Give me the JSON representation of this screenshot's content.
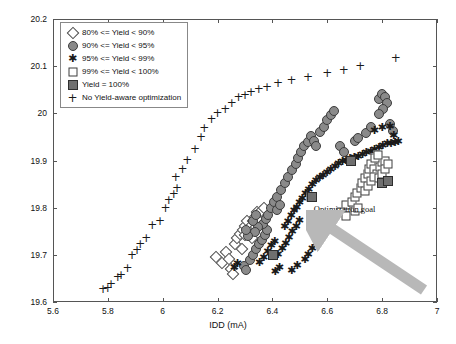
{
  "axes": {
    "x_title": "IDD (mA)",
    "y_title": "S21 (dB)",
    "x_ticks": [
      "5.6",
      "5.8",
      "6",
      "6.2",
      "6.4",
      "6.6",
      "6.8",
      "7"
    ],
    "y_ticks": [
      "19.6",
      "19.7",
      "19.8",
      "19.9",
      "20",
      "20.1",
      "20.2"
    ]
  },
  "legend": {
    "items": [
      {
        "marker": "open-diamond",
        "label": "80% <= Yield < 90%"
      },
      {
        "marker": "filled-circle",
        "label": "90% <= Yield < 95%"
      },
      {
        "marker": "asterisk",
        "label": "95% <= Yield < 99%"
      },
      {
        "marker": "open-square",
        "label": "99% <= Yield < 100%"
      },
      {
        "marker": "filled-square",
        "label": "Yield = 100%"
      },
      {
        "marker": "plus",
        "label": "No Yield-aware optimization"
      }
    ]
  },
  "annotation": {
    "text": "Optimization goal",
    "arrow_color": "#b3b3b3",
    "arrow_from": [
      6.92,
      19.64
    ],
    "arrow_to": [
      6.62,
      19.77
    ]
  },
  "chart_data": {
    "type": "scatter",
    "title": "",
    "xlabel": "IDD (mA)",
    "ylabel": "S21 (dB)",
    "xlim": [
      5.6,
      7.0
    ],
    "ylim": [
      19.6,
      20.2
    ],
    "grid": false,
    "legend_position": "top-left",
    "series": [
      {
        "name": "80% <= Yield < 90%",
        "marker": "open-diamond",
        "color": "#ffffff",
        "edge_color": "#4a4a4a",
        "points": [
          [
            6.195,
            19.695
          ],
          [
            6.215,
            19.682
          ],
          [
            6.232,
            19.705
          ],
          [
            6.243,
            19.692
          ],
          [
            6.262,
            19.724
          ],
          [
            6.272,
            19.735
          ],
          [
            6.283,
            19.745
          ],
          [
            6.292,
            19.752
          ],
          [
            6.3,
            19.762
          ],
          [
            6.308,
            19.771
          ],
          [
            6.3,
            19.742
          ],
          [
            6.312,
            19.752
          ],
          [
            6.322,
            19.762
          ],
          [
            6.33,
            19.772
          ],
          [
            6.338,
            19.781
          ],
          [
            6.345,
            19.79
          ],
          [
            6.352,
            19.783
          ],
          [
            6.36,
            19.793
          ],
          [
            6.368,
            19.8
          ],
          [
            6.34,
            19.76
          ],
          [
            6.355,
            19.77
          ],
          [
            6.327,
            19.735
          ],
          [
            6.288,
            19.712
          ],
          [
            6.248,
            19.67
          ],
          [
            6.258,
            19.66
          ]
        ]
      },
      {
        "name": "90% <= Yield < 95%",
        "marker": "filled-circle",
        "color": "#8a8a8a",
        "edge_color": "#3c3c3c",
        "points": [
          [
            6.295,
            19.676
          ],
          [
            6.305,
            19.668
          ],
          [
            6.318,
            19.69
          ],
          [
            6.33,
            19.7
          ],
          [
            6.34,
            19.712
          ],
          [
            6.352,
            19.722
          ],
          [
            6.362,
            19.732
          ],
          [
            6.372,
            19.742
          ],
          [
            6.382,
            19.752
          ],
          [
            6.365,
            19.765
          ],
          [
            6.375,
            19.775
          ],
          [
            6.385,
            19.785
          ],
          [
            6.348,
            19.758
          ],
          [
            6.336,
            19.748
          ],
          [
            6.312,
            19.74
          ],
          [
            6.302,
            19.752
          ],
          [
            6.328,
            19.772
          ],
          [
            6.34,
            19.785
          ],
          [
            6.395,
            19.8
          ],
          [
            6.405,
            19.812
          ],
          [
            6.418,
            19.822
          ],
          [
            6.432,
            19.838
          ],
          [
            6.445,
            19.852
          ],
          [
            6.458,
            19.866
          ],
          [
            6.47,
            19.88
          ],
          [
            6.485,
            19.892
          ],
          [
            6.492,
            19.905
          ],
          [
            6.505,
            19.918
          ],
          [
            6.515,
            19.93
          ],
          [
            6.528,
            19.94
          ],
          [
            6.54,
            19.952
          ],
          [
            6.552,
            19.942
          ],
          [
            6.56,
            19.93
          ],
          [
            6.572,
            19.96
          ],
          [
            6.588,
            19.972
          ],
          [
            6.6,
            19.985
          ],
          [
            6.612,
            19.996
          ],
          [
            6.625,
            20.005
          ],
          [
            6.648,
            19.93
          ],
          [
            6.66,
            19.918
          ],
          [
            6.7,
            19.942
          ],
          [
            6.712,
            19.948
          ],
          [
            6.742,
            19.958
          ],
          [
            6.76,
            19.97
          ],
          [
            6.788,
            20.03
          ],
          [
            6.8,
            20.042
          ],
          [
            6.812,
            20.035
          ],
          [
            6.818,
            20.022
          ],
          [
            6.802,
            20.01
          ],
          [
            6.79,
            19.998
          ],
          [
            6.828,
            19.978
          ],
          [
            6.84,
            19.962
          ],
          [
            6.416,
            19.795
          ],
          [
            6.428,
            19.806
          ]
        ]
      },
      {
        "name": "95% <= Yield < 99%",
        "marker": "asterisk",
        "color": "#1a1a1a",
        "points": [
          [
            6.352,
            19.682
          ],
          [
            6.368,
            19.694
          ],
          [
            6.382,
            19.706
          ],
          [
            6.395,
            19.718
          ],
          [
            6.408,
            19.728
          ],
          [
            6.42,
            19.7
          ],
          [
            6.435,
            19.712
          ],
          [
            6.448,
            19.724
          ],
          [
            6.46,
            19.736
          ],
          [
            6.472,
            19.748
          ],
          [
            6.486,
            19.76
          ],
          [
            6.498,
            19.772
          ],
          [
            6.444,
            19.758
          ],
          [
            6.456,
            19.77
          ],
          [
            6.468,
            19.782
          ],
          [
            6.478,
            19.792
          ],
          [
            6.488,
            19.8
          ],
          [
            6.498,
            19.81
          ],
          [
            6.508,
            19.818
          ],
          [
            6.52,
            19.828
          ],
          [
            6.532,
            19.838
          ],
          [
            6.545,
            19.848
          ],
          [
            6.558,
            19.856
          ],
          [
            6.572,
            19.862
          ],
          [
            6.584,
            19.868
          ],
          [
            6.598,
            19.874
          ],
          [
            6.612,
            19.88
          ],
          [
            6.628,
            19.886
          ],
          [
            6.64,
            19.892
          ],
          [
            6.655,
            19.896
          ],
          [
            6.668,
            19.9
          ],
          [
            6.682,
            19.904
          ],
          [
            6.698,
            19.906
          ],
          [
            6.712,
            19.908
          ],
          [
            6.728,
            19.912
          ],
          [
            6.742,
            19.916
          ],
          [
            6.758,
            19.918
          ],
          [
            6.772,
            19.922
          ],
          [
            6.788,
            19.926
          ],
          [
            6.802,
            19.93
          ],
          [
            6.818,
            19.934
          ],
          [
            6.832,
            19.936
          ],
          [
            6.846,
            19.938
          ],
          [
            6.858,
            19.94
          ],
          [
            6.772,
            19.962
          ],
          [
            6.8,
            19.968
          ],
          [
            6.828,
            19.972
          ],
          [
            6.842,
            19.952
          ],
          [
            6.518,
            19.69
          ],
          [
            6.53,
            19.7
          ],
          [
            6.545,
            19.712
          ],
          [
            6.56,
            19.722
          ],
          [
            6.41,
            19.664
          ],
          [
            6.425,
            19.672
          ],
          [
            6.47,
            19.665
          ],
          [
            6.49,
            19.676
          ],
          [
            6.26,
            19.672
          ],
          [
            6.272,
            19.68
          ]
        ]
      },
      {
        "name": "99% <= Yield < 100%",
        "marker": "open-square",
        "color": "#ffffff",
        "edge_color": "#3c3c3c",
        "points": [
          [
            6.54,
            19.822
          ],
          [
            6.668,
            19.806
          ],
          [
            6.69,
            19.812
          ],
          [
            6.7,
            19.822
          ],
          [
            6.71,
            19.832
          ],
          [
            6.722,
            19.842
          ],
          [
            6.728,
            19.852
          ],
          [
            6.738,
            19.862
          ],
          [
            6.748,
            19.872
          ],
          [
            6.752,
            19.882
          ],
          [
            6.76,
            19.892
          ],
          [
            6.772,
            19.882
          ],
          [
            6.782,
            19.872
          ],
          [
            6.792,
            19.886
          ],
          [
            6.8,
            19.896
          ],
          [
            6.812,
            19.9
          ],
          [
            6.738,
            19.836
          ],
          [
            6.748,
            19.846
          ],
          [
            6.76,
            19.856
          ],
          [
            6.77,
            19.866
          ],
          [
            6.788,
            19.862
          ],
          [
            6.8,
            19.872
          ],
          [
            6.812,
            19.882
          ],
          [
            6.822,
            19.892
          ],
          [
            6.65,
            19.79
          ],
          [
            6.668,
            19.782
          ],
          [
            6.7,
            19.792
          ],
          [
            6.712,
            19.8
          ],
          [
            6.775,
            19.906
          ],
          [
            6.786,
            19.912
          ]
        ]
      },
      {
        "name": "Yield = 100%",
        "marker": "filled-square",
        "color": "#6f6f6f",
        "edge_color": "#2e2e2e",
        "points": [
          [
            6.402,
            19.7
          ],
          [
            6.545,
            19.822
          ],
          [
            6.8,
            19.852
          ],
          [
            6.82,
            19.856
          ],
          [
            6.688,
            19.898
          ]
        ]
      },
      {
        "name": "No Yield-aware optimization",
        "marker": "plus",
        "color": "#1a1a1a",
        "points": [
          [
            5.782,
            19.628
          ],
          [
            5.8,
            19.63
          ],
          [
            5.812,
            19.638
          ],
          [
            5.836,
            19.652
          ],
          [
            5.848,
            19.658
          ],
          [
            5.872,
            19.672
          ],
          [
            5.888,
            19.7
          ],
          [
            5.906,
            19.71
          ],
          [
            5.918,
            19.722
          ],
          [
            5.94,
            19.736
          ],
          [
            5.962,
            19.764
          ],
          [
            5.99,
            19.772
          ],
          [
            6.01,
            19.8
          ],
          [
            6.022,
            19.816
          ],
          [
            6.04,
            19.83
          ],
          [
            6.052,
            19.842
          ],
          [
            6.048,
            19.866
          ],
          [
            6.072,
            19.882
          ],
          [
            6.09,
            19.902
          ],
          [
            6.118,
            19.925
          ],
          [
            6.14,
            19.95
          ],
          [
            6.152,
            19.968
          ],
          [
            6.178,
            19.988
          ],
          [
            6.2,
            20.0
          ],
          [
            6.228,
            20.01
          ],
          [
            6.252,
            20.022
          ],
          [
            6.276,
            20.034
          ],
          [
            6.3,
            20.038
          ],
          [
            6.322,
            20.046
          ],
          [
            6.35,
            20.052
          ],
          [
            6.38,
            20.056
          ],
          [
            6.42,
            20.064
          ],
          [
            6.47,
            20.07
          ],
          [
            6.53,
            20.078
          ],
          [
            6.6,
            20.085
          ],
          [
            6.66,
            20.092
          ],
          [
            6.72,
            20.1
          ],
          [
            6.85,
            20.118
          ]
        ]
      }
    ]
  }
}
